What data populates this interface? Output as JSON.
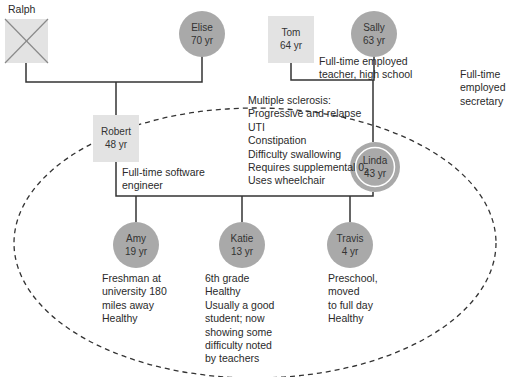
{
  "diagram": {
    "type": "genogram",
    "household_boundary": "dashed ellipse",
    "colors": {
      "male_fill": "#e3e3e3",
      "female_fill": "#a9a9a9",
      "line": "#333333",
      "deceased_cross": "#8a8a8a",
      "identified_patient_ring": "#ffffff"
    },
    "people": {
      "ralph": {
        "name": "Ralph",
        "age": "",
        "sex": "male",
        "status": "deceased"
      },
      "elise": {
        "name": "Elise",
        "age": "70 yr",
        "sex": "female"
      },
      "tom": {
        "name": "Tom",
        "age": "64 yr",
        "sex": "male"
      },
      "sally": {
        "name": "Sally",
        "age": "63 yr",
        "sex": "female"
      },
      "robert": {
        "name": "Robert",
        "age": "48 yr",
        "sex": "male"
      },
      "linda": {
        "name": "Linda",
        "age": "43 yr",
        "sex": "female",
        "identified_patient": true
      },
      "amy": {
        "name": "Amy",
        "age": "19 yr",
        "sex": "female"
      },
      "katie": {
        "name": "Katie",
        "age": "13 yr",
        "sex": "female"
      },
      "travis": {
        "name": "Travis",
        "age": "4 yr",
        "sex": "male"
      }
    },
    "notes": {
      "tom": [
        "Full-time employed",
        "teacher, high school"
      ],
      "sally": [
        "Full-time",
        "employed",
        "secretary"
      ],
      "robert": [
        "Full-time software",
        "engineer"
      ],
      "linda": [
        "Multiple sclerosis:",
        "Progressive and relapse",
        "UTI",
        "Constipation",
        "Difficulty swallowing",
        "Requires supplemental 0",
        "Uses wheelchair"
      ],
      "linda_subscript": "2",
      "amy": [
        "Freshman at",
        "university 180",
        "miles away",
        "Healthy"
      ],
      "katie": [
        "6th grade",
        "Healthy",
        "Usually a good",
        "student; now",
        "showing some",
        "difficulty noted",
        "by teachers"
      ],
      "travis": [
        "Preschool,",
        "moved",
        "to full day",
        "Healthy"
      ]
    },
    "relationships": [
      {
        "type": "marriage",
        "partners": [
          "Ralph",
          "Elise"
        ],
        "children": [
          "Robert"
        ]
      },
      {
        "type": "marriage",
        "partners": [
          "Tom",
          "Sally"
        ],
        "children": [
          "Linda"
        ]
      },
      {
        "type": "marriage",
        "partners": [
          "Robert",
          "Linda"
        ],
        "children": [
          "Amy",
          "Katie",
          "Travis"
        ]
      }
    ]
  }
}
